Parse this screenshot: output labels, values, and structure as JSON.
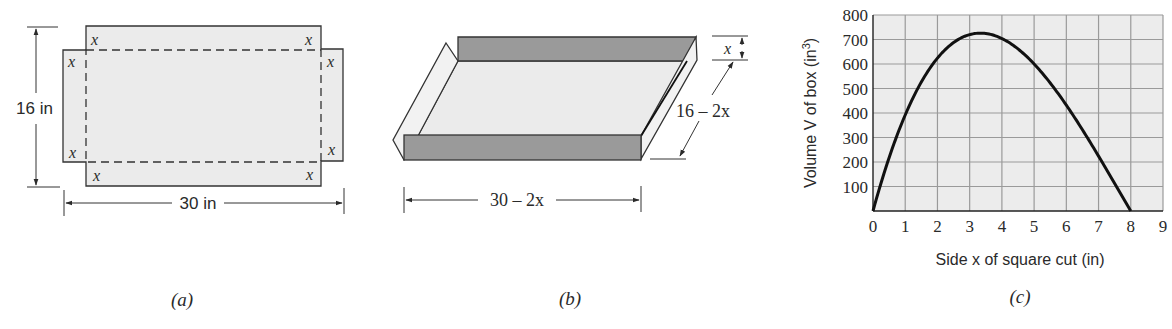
{
  "panels": {
    "a": {
      "caption": "(a)",
      "height_label": "16 in",
      "width_label": "30 in",
      "corner_label": "x",
      "fill_color": "#ebebeb",
      "stroke_color": "#333333"
    },
    "b": {
      "caption": "(b)",
      "height_label": "x",
      "depth_label": "16 – 2x",
      "width_label": "30 – 2x",
      "wall_color": "#9a9a9a",
      "floor_color": "#ebebeb",
      "side_color": "#f2f2f2"
    },
    "c": {
      "caption": "(c)"
    }
  },
  "chart_data": {
    "type": "line",
    "title": "",
    "xlabel": "Side x of square cut (in)",
    "ylabel": "Volume V of box (in³)",
    "ylabel_parts": {
      "main": "Volume V of box (in",
      "sup": "3",
      "end": ")"
    },
    "xlim": [
      0,
      9
    ],
    "ylim": [
      0,
      800
    ],
    "xticks": [
      "0",
      "1",
      "2",
      "3",
      "4",
      "5",
      "6",
      "7",
      "8",
      "9"
    ],
    "yticks": [
      "100",
      "200",
      "300",
      "400",
      "500",
      "600",
      "700",
      "800"
    ],
    "grid": true,
    "legend": "none",
    "series": [
      {
        "name": "V(x) = x(30 − 2x)(16 − 2x)",
        "x": [
          0,
          0.25,
          0.5,
          0.75,
          1,
          1.5,
          2,
          2.5,
          3,
          3.33,
          3.5,
          4,
          4.5,
          5,
          5.5,
          6,
          6.5,
          7,
          7.5,
          8
        ],
        "values": [
          0,
          110.5,
          203,
          279,
          392,
          507,
          624,
          687.5,
          720,
          725.9,
          724.5,
          704,
          661.5,
          600,
          522.5,
          432,
          331.5,
          224,
          112.5,
          0
        ]
      }
    ],
    "grid_color": "#9a9a9a",
    "plot_bg": "#ececec",
    "curve_color": "#111111"
  }
}
